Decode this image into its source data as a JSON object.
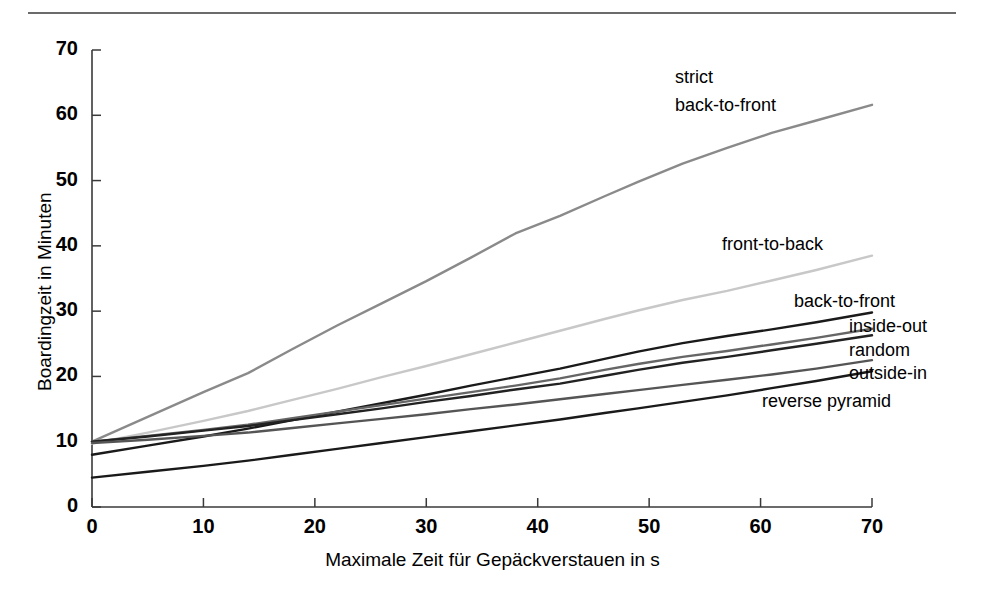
{
  "figure": {
    "top_rule": "horizontal-rule"
  },
  "chart_data": {
    "type": "line",
    "title": "",
    "subtitle": "",
    "xlabel": "Maximale Zeit für Gepäckverstauen in s",
    "ylabel": "Boardingzeit in Minuten",
    "xlim": [
      0,
      70
    ],
    "ylim": [
      0,
      70
    ],
    "xticks": [
      0,
      10,
      20,
      30,
      40,
      50,
      60,
      70
    ],
    "yticks": [
      0,
      10,
      20,
      30,
      40,
      50,
      60,
      70
    ],
    "xtick_labels": [
      "0",
      "10",
      "20",
      "30",
      "40",
      "50",
      "60",
      "70"
    ],
    "ytick_labels": [
      "0",
      "10",
      "20",
      "30",
      "40",
      "50",
      "60",
      "70"
    ],
    "grid": false,
    "legend_position": "inline-right-of-curves",
    "x": [
      0,
      5,
      10,
      14,
      18,
      22,
      26,
      30,
      34,
      38,
      42,
      46,
      49,
      53,
      57,
      61,
      65,
      70
    ],
    "series": [
      {
        "name": "strict back-to-front",
        "label": "strict\nback-to-front",
        "color": "#8a8a8a",
        "values": [
          10.0,
          13.8,
          17.6,
          20.5,
          24.2,
          27.8,
          31.2,
          34.6,
          38.2,
          41.9,
          44.6,
          47.6,
          49.8,
          52.6,
          55.0,
          57.3,
          59.2,
          61.6
        ]
      },
      {
        "name": "front-to-back",
        "label": "front-to-back",
        "color": "#c8c8c8",
        "values": [
          9.7,
          11.4,
          13.2,
          14.7,
          16.4,
          18.1,
          19.9,
          21.6,
          23.4,
          25.2,
          27.0,
          28.8,
          30.1,
          31.7,
          33.1,
          34.7,
          36.3,
          38.5
        ]
      },
      {
        "name": "back-to-front",
        "label": "back-to-front",
        "color": "#1a1a1a",
        "values": [
          8.0,
          9.4,
          10.8,
          12.0,
          13.3,
          14.6,
          15.9,
          17.2,
          18.6,
          19.9,
          21.2,
          22.7,
          23.8,
          25.1,
          26.2,
          27.2,
          28.3,
          29.8
        ]
      },
      {
        "name": "inside-out",
        "label": "inside-out",
        "color": "#666666",
        "values": [
          10.0,
          10.9,
          11.8,
          12.6,
          13.6,
          14.6,
          15.6,
          16.6,
          17.6,
          18.6,
          19.7,
          21.0,
          21.9,
          23.0,
          23.9,
          24.9,
          25.9,
          27.3
        ]
      },
      {
        "name": "random",
        "label": "random",
        "color": "#222222",
        "values": [
          10.0,
          10.8,
          11.7,
          12.4,
          13.3,
          14.2,
          15.1,
          16.1,
          17.0,
          18.0,
          18.9,
          20.1,
          21.0,
          22.1,
          23.0,
          24.0,
          25.0,
          26.3
        ]
      },
      {
        "name": "outside-in",
        "label": "outside-in",
        "color": "#555555",
        "values": [
          9.8,
          10.3,
          10.9,
          11.4,
          12.1,
          12.8,
          13.5,
          14.2,
          15.0,
          15.7,
          16.5,
          17.3,
          17.9,
          18.7,
          19.5,
          20.3,
          21.2,
          22.5
        ]
      },
      {
        "name": "reverse pyramid",
        "label": "reverse pyramid",
        "color": "#1a1a1a",
        "values": [
          4.5,
          5.4,
          6.3,
          7.1,
          8.0,
          8.9,
          9.8,
          10.7,
          11.6,
          12.5,
          13.4,
          14.4,
          15.1,
          16.1,
          17.1,
          18.2,
          19.3,
          20.8
        ]
      }
    ],
    "annotations": [
      {
        "text_line1": "strict",
        "text_line2": "back-to-front",
        "series": "strict back-to-front"
      },
      {
        "text_line1": "front-to-back",
        "text_line2": "",
        "series": "front-to-back"
      },
      {
        "text_line1": "back-to-front",
        "text_line2": "",
        "series": "back-to-front"
      },
      {
        "text_line1": "inside-out",
        "text_line2": "",
        "series": "inside-out"
      },
      {
        "text_line1": "random",
        "text_line2": "",
        "series": "random"
      },
      {
        "text_line1": "outside-in",
        "text_line2": "",
        "series": "outside-in"
      },
      {
        "text_line1": "reverse pyramid",
        "text_line2": "",
        "series": "reverse pyramid"
      }
    ]
  },
  "labels": {
    "strict_l1": "strict",
    "strict_l2": "back-to-front",
    "front_to_back": "front-to-back",
    "back_to_front": "back-to-front",
    "inside_out": "inside-out",
    "random": "random",
    "outside_in": "outside-in",
    "reverse_pyramid": "reverse pyramid"
  },
  "axis": {
    "x_title": "Maximale Zeit für Gepäckverstauen in s",
    "y_title": "Boardingzeit in Minuten"
  },
  "colors": {
    "axis": "#3a3a3a",
    "rule": "#6b6b6b",
    "strict_back_to_front": "#8a8a8a",
    "front_to_back": "#c8c8c8",
    "back_to_front": "#1a1a1a",
    "inside_out": "#666666",
    "random": "#222222",
    "outside_in": "#555555",
    "reverse_pyramid": "#1a1a1a"
  }
}
